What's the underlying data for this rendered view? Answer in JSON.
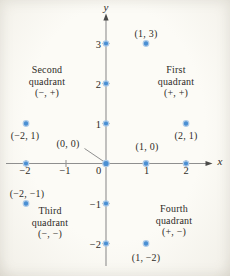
{
  "figure": {
    "axis": {
      "x_label": "x",
      "y_label": "y"
    },
    "x_ticks": [
      {
        "value": -2,
        "label": "−2",
        "dot": true
      },
      {
        "value": -1,
        "label": "−1",
        "dot": false
      },
      {
        "value": 0,
        "label": "0",
        "dot": false
      },
      {
        "value": 1,
        "label": "1",
        "dot": true
      },
      {
        "value": 2,
        "label": "2",
        "dot": true
      }
    ],
    "y_ticks": [
      {
        "value": 3,
        "label": "3",
        "dot": true
      },
      {
        "value": 2,
        "label": "2",
        "dot": true
      },
      {
        "value": 1,
        "label": "1",
        "dot": true
      },
      {
        "value": -1,
        "label": "−1",
        "dot": true
      },
      {
        "value": -2,
        "label": "−2",
        "dot": true
      }
    ],
    "points": [
      {
        "x": 1,
        "y": 3,
        "label": "(1, 3)"
      },
      {
        "x": -2,
        "y": 1,
        "label": "(−2, 1)"
      },
      {
        "x": 2,
        "y": 1,
        "label": "(2, 1)"
      },
      {
        "x": 0,
        "y": 0,
        "label": "(0, 0)"
      },
      {
        "x": 1,
        "y": 0,
        "label": "(1, 0)"
      },
      {
        "x": -2,
        "y": -1,
        "label": "(−2, −1)"
      },
      {
        "x": 1,
        "y": -2,
        "label": "(1, −2)"
      }
    ],
    "quadrants": [
      {
        "name": "second",
        "lines": [
          "Second",
          "quadrant",
          "(−, +)"
        ]
      },
      {
        "name": "first",
        "lines": [
          "First",
          "quadrant",
          "(+, +)"
        ]
      },
      {
        "name": "third",
        "lines": [
          "Third",
          "quadrant",
          "(−, −)"
        ]
      },
      {
        "name": "fourth",
        "lines": [
          "Fourth",
          "quadrant",
          "(+, −)"
        ]
      }
    ],
    "colors": {
      "point_fill": "#4a8fd3",
      "point_halo": "#aecbe9",
      "axis_line": "#8f8f8f",
      "arrowhead": "#4a4a48",
      "text": "#2e2b27"
    }
  },
  "chart_data": {
    "type": "scatter",
    "title": "",
    "xlabel": "x",
    "ylabel": "y",
    "xlim": [
      -2.5,
      2.6
    ],
    "ylim": [
      -2.8,
      3.7
    ],
    "points": [
      [
        1,
        3
      ],
      [
        -2,
        1
      ],
      [
        2,
        1
      ],
      [
        0,
        0
      ],
      [
        1,
        0
      ],
      [
        -2,
        -1
      ],
      [
        1,
        -2
      ]
    ],
    "annotations": [
      "Second quadrant (−, +)",
      "First quadrant (+, +)",
      "Third quadrant (−, −)",
      "Fourth quadrant (+, −)"
    ]
  }
}
